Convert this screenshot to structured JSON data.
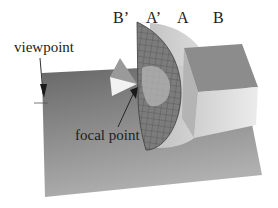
{
  "figure": {
    "labels": {
      "b_prime": "B’",
      "a_prime": "A’",
      "a": "A",
      "b": "B",
      "viewpoint": "viewpoint",
      "focal_point": "focal point"
    },
    "colors": {
      "background": "#ffffff",
      "floor_dark": "#6e6e6e",
      "floor_light": "#a8a8a8",
      "mesh_hemisphere": "#7a7a7a",
      "sphere_shell": "#c9c9c9",
      "box_top": "#8a8a8a",
      "box_front": "#d8d8d8",
      "cone_light": "#f2f2f2",
      "cone_mid": "#9a9a9a",
      "text": "#1c1c1c"
    }
  }
}
